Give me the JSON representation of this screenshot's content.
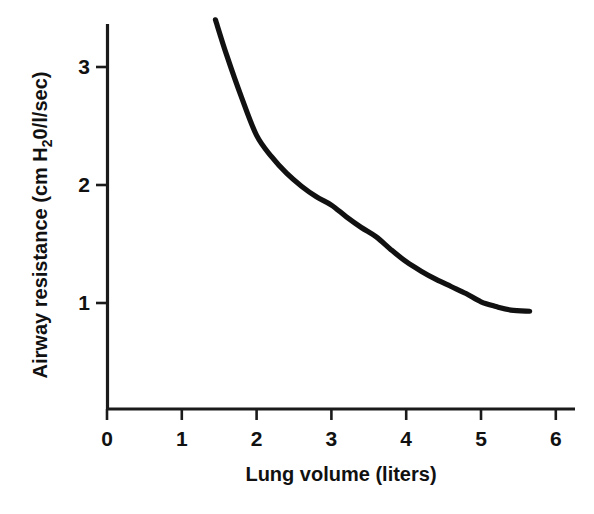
{
  "chart_data": {
    "type": "line",
    "title": "",
    "xlabel": "Lung volume (liters)",
    "ylabel": "Airway resistance (cm H₂0/l/sec)",
    "ylabel_parts": {
      "prefix": "Airway resistance (cm H",
      "subscript": "2",
      "suffix": "0/l/sec)"
    },
    "xlim": [
      0,
      6
    ],
    "ylim": [
      0,
      3.5
    ],
    "xticks": [
      0,
      1,
      2,
      3,
      4,
      5,
      6
    ],
    "xtick_labels": [
      "0",
      "1",
      "2",
      "3",
      "4",
      "5",
      "6"
    ],
    "yticks": [
      1,
      2,
      3
    ],
    "ytick_labels": [
      "1",
      "2",
      "3"
    ],
    "grid": false,
    "legend": null,
    "series": [
      {
        "name": "Airway resistance",
        "color": "#111111",
        "x": [
          1.45,
          1.6,
          1.8,
          2.0,
          2.2,
          2.4,
          2.6,
          2.8,
          3.0,
          3.2,
          3.4,
          3.6,
          3.8,
          4.0,
          4.2,
          4.4,
          4.6,
          4.8,
          5.0,
          5.2,
          5.4,
          5.65
        ],
        "y": [
          3.4,
          3.1,
          2.74,
          2.42,
          2.24,
          2.1,
          1.99,
          1.9,
          1.83,
          1.73,
          1.64,
          1.56,
          1.45,
          1.35,
          1.27,
          1.2,
          1.14,
          1.08,
          1.01,
          0.97,
          0.94,
          0.93
        ]
      }
    ]
  },
  "figure": {
    "background_color": "#ffffff",
    "axis_color": "#1a1a1a",
    "curve_color": "#111111"
  },
  "geometry": {
    "x_origin_px": 107,
    "y_unit_px": 74.8,
    "y_baseline_px": 303,
    "y_unit_height_px": 118,
    "axis_bottom_px": 409,
    "axis_top_px": 24
  }
}
